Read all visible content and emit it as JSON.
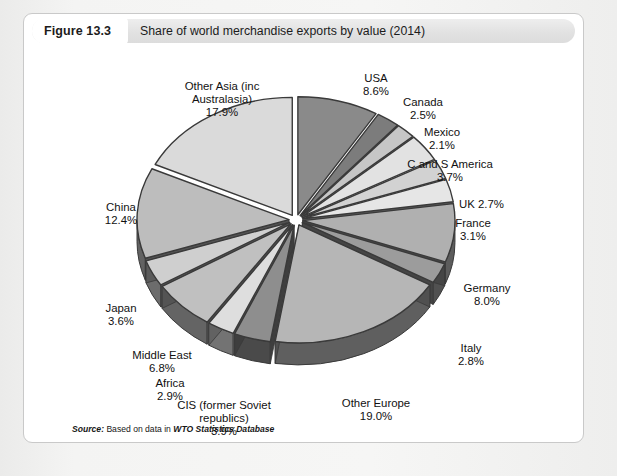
{
  "figure": {
    "number_label": "Figure 13.3",
    "title": "Share of world merchandise exports by value (2014)",
    "source_prefix": "Source:",
    "source_text": " Based on data in ",
    "source_database": "WTO Statistics Database"
  },
  "chart_data": {
    "type": "pie",
    "title": "Share of world merchandise exports by value (2014)",
    "unit": "%",
    "exploded": true,
    "three_d": true,
    "start_angle_deg": -90,
    "direction": "clockwise",
    "categories": [
      "USA",
      "Canada",
      "Mexico",
      "C and S America",
      "UK",
      "France",
      "Germany",
      "Italy",
      "Other Europe",
      "CIS (former Soviet republics)",
      "Africa",
      "Middle East",
      "Japan",
      "China",
      "Other Asia (inc Australasia)"
    ],
    "values": [
      8.6,
      2.5,
      2.1,
      3.7,
      2.7,
      3.1,
      8.0,
      2.8,
      19.0,
      3.9,
      2.9,
      6.8,
      3.6,
      12.4,
      17.9
    ],
    "slice_colors": [
      "#8a8a8a",
      "#7c7c7c",
      "#c6c6c6",
      "#e2e2e2",
      "#d2d2d2",
      "#e6e6e6",
      "#b0b0b0",
      "#9c9c9c",
      "#b6b6b6",
      "#8e8e8e",
      "#dedede",
      "#c0c0c0",
      "#cfcfcf",
      "#bdbdbd",
      "#dadada"
    ],
    "labels": [
      {
        "name": "USA",
        "text": "USA\n8.6%",
        "x": 352,
        "y": 24,
        "align": "center",
        "w": 60
      },
      {
        "name": "Canada",
        "text": "Canada\n2.5%",
        "x": 399,
        "y": 48,
        "align": "center",
        "w": 60
      },
      {
        "name": "Mexico",
        "text": "Mexico\n2.1%",
        "x": 418,
        "y": 78,
        "align": "center",
        "w": 60
      },
      {
        "name": "C and S America",
        "text": "C and S America\n3.7%",
        "x": 426,
        "y": 110,
        "align": "center",
        "w": 110
      },
      {
        "name": "UK",
        "text": "UK 2.7%",
        "x": 435,
        "y": 150,
        "align": "left",
        "w": 70
      },
      {
        "name": "France",
        "text": "France\n3.1%",
        "x": 449,
        "y": 169,
        "align": "center",
        "w": 60
      },
      {
        "name": "Germany",
        "text": "Germany\n8.0%",
        "x": 463,
        "y": 234,
        "align": "center",
        "w": 70
      },
      {
        "name": "Italy",
        "text": "Italy\n2.8%",
        "x": 447,
        "y": 294,
        "align": "center",
        "w": 50
      },
      {
        "name": "Other Europe",
        "text": "Other Europe\n19.0%",
        "x": 352,
        "y": 349,
        "align": "center",
        "w": 100
      },
      {
        "name": "CIS (former Soviet republics)",
        "text": "CIS (former Soviet\nrepublics)\n3.9%",
        "x": 200,
        "y": 351,
        "align": "center",
        "w": 120
      },
      {
        "name": "Africa",
        "text": "Africa\n2.9%",
        "x": 146,
        "y": 329,
        "align": "center",
        "w": 60
      },
      {
        "name": "Middle East",
        "text": "Middle East\n6.8%",
        "x": 138,
        "y": 301,
        "align": "center",
        "w": 90
      },
      {
        "name": "Japan",
        "text": "Japan\n3.6%",
        "x": 97,
        "y": 254,
        "align": "center",
        "w": 60
      },
      {
        "name": "China",
        "text": "China\n12.4%",
        "x": 97,
        "y": 153,
        "align": "center",
        "w": 60
      },
      {
        "name": "Other Asia (inc Australasia)",
        "text": "Other Asia (inc\nAustralasia)\n17.9%",
        "x": 198,
        "y": 32,
        "align": "center",
        "w": 130
      }
    ]
  },
  "colors": {
    "page_background": "#f2f2f1",
    "figure_background": "#ffffff",
    "figure_border": "#c9c9c9",
    "header_pill": "#e2e2e2",
    "text": "#1c1c1c",
    "slice_edge": "#3a3a3a",
    "slice_side_dark": "#4a4a4a"
  }
}
